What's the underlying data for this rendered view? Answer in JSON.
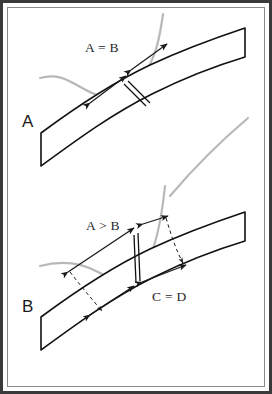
{
  "figure": {
    "background_color": "#ffffff",
    "frame": {
      "outer_border_color": "#3a3a3a",
      "outer_border_width_px": 3,
      "inner_margin_color": "#ffffff"
    },
    "colors": {
      "band_stroke": "#111111",
      "gray_curve": "#b3b3b3",
      "arrow_stroke": "#1a1a1a",
      "dashed_arrow_stroke": "#1a1a1a",
      "label_text": "#2a2a2a",
      "panel_label_text": "#1b1b1b"
    },
    "panels": [
      {
        "id": "panel-a",
        "label": "A",
        "label_x": 22,
        "label_y": 127,
        "measures": [
          {
            "id": "measure-a-equals-b",
            "text": "A = B",
            "x": 85,
            "y": 52,
            "relation": "equal",
            "segments": [
              {
                "name": "A",
                "length_px": 47
              },
              {
                "name": "B",
                "length_px": 47
              }
            ]
          }
        ],
        "elements": [
          "curved-band",
          "gray-sigmoid-curve",
          "cross-connector",
          "double-headed-arrow-left",
          "double-headed-arrow-right"
        ]
      },
      {
        "id": "panel-b",
        "label": "B",
        "label_x": 22,
        "label_y": 312,
        "measures": [
          {
            "id": "measure-a-greater-b",
            "text": "A > B",
            "x": 86,
            "y": 230,
            "relation": "greater",
            "segments": [
              {
                "name": "A",
                "length_px": 78
              },
              {
                "name": "B",
                "length_px": 24
              }
            ]
          },
          {
            "id": "measure-c-equals-d",
            "text": "C = D",
            "x": 152,
            "y": 301,
            "relation": "equal",
            "segments": [
              {
                "name": "C",
                "length_px": 44
              },
              {
                "name": "D",
                "length_px": 44
              }
            ]
          }
        ],
        "elements": [
          "curved-band",
          "gray-descending-curve",
          "cross-connector",
          "double-headed-arrow-upper-left",
          "double-headed-arrow-upper-right",
          "double-headed-arrow-lower-left",
          "double-headed-arrow-lower-right",
          "dashed-projection-arrow-left",
          "dashed-projection-arrow-right"
        ]
      }
    ]
  }
}
